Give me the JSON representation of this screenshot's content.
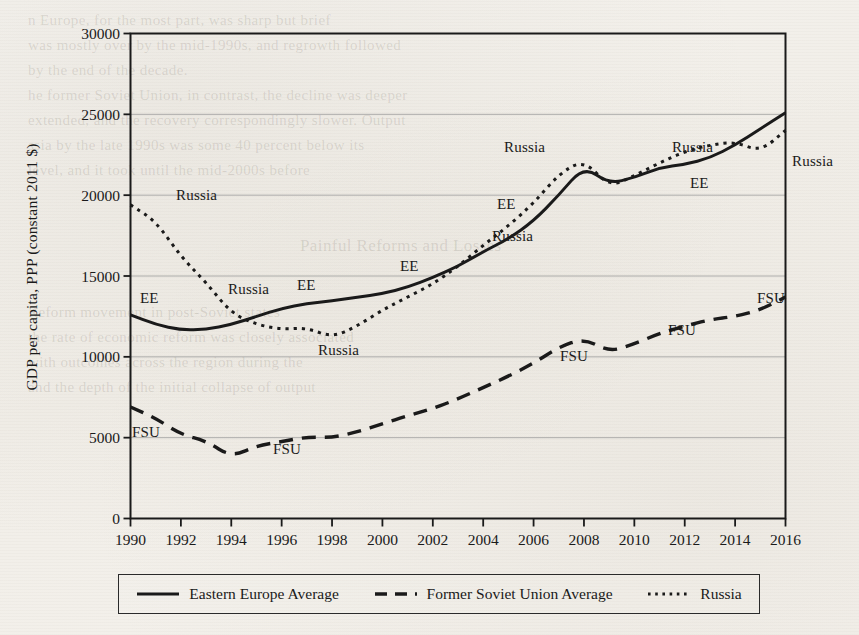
{
  "figure": {
    "background_color": "#f4f2ee",
    "ink_color": "#1a1a1a",
    "gridline_color": "#9a9a9a"
  },
  "axes": {
    "ylabel": "GDP per capita, PPP (constant 2011 $)",
    "xlabel": "",
    "yticks": [
      "30000",
      "25000",
      "20000",
      "15000",
      "10000",
      "5000",
      "0"
    ],
    "xticks": [
      "1990",
      "1992",
      "1994",
      "1996",
      "1998",
      "2000",
      "2002",
      "2004",
      "2006",
      "2008",
      "2010",
      "2012",
      "2014",
      "2016"
    ]
  },
  "legend": {
    "items": [
      {
        "label": "Eastern Europe Average",
        "style": "solid"
      },
      {
        "label": "Former Soviet Union Average",
        "style": "dashed"
      },
      {
        "label": "Russia",
        "style": "dotted"
      }
    ]
  },
  "inline_labels": [
    {
      "text": "EE",
      "x": 140,
      "y": 290
    },
    {
      "text": "Russia",
      "x": 176,
      "y": 187
    },
    {
      "text": "Russia",
      "x": 228,
      "y": 281
    },
    {
      "text": "Russia",
      "x": 318,
      "y": 342
    },
    {
      "text": "EE",
      "x": 297,
      "y": 277
    },
    {
      "text": "EE",
      "x": 400,
      "y": 258
    },
    {
      "text": "EE",
      "x": 497,
      "y": 196
    },
    {
      "text": "Russia",
      "x": 492,
      "y": 228
    },
    {
      "text": "Russia",
      "x": 504,
      "y": 139
    },
    {
      "text": "Russia",
      "x": 672,
      "y": 139
    },
    {
      "text": "EE",
      "x": 690,
      "y": 175
    },
    {
      "text": "Russia",
      "x": 792,
      "y": 153
    },
    {
      "text": "FSU",
      "x": 132,
      "y": 424
    },
    {
      "text": "FSU",
      "x": 273,
      "y": 441
    },
    {
      "text": "FSU",
      "x": 560,
      "y": 348
    },
    {
      "text": "FSU",
      "x": 668,
      "y": 322
    },
    {
      "text": "FSU",
      "x": 757,
      "y": 290
    }
  ],
  "chart_data": {
    "type": "line",
    "title": "",
    "xlabel": "",
    "ylabel": "GDP per capita, PPP (constant 2011 $)",
    "xlim": [
      1990,
      2016
    ],
    "ylim": [
      0,
      30000
    ],
    "ytick_step": 5000,
    "grid": true,
    "legend_position": "bottom",
    "x": [
      1990,
      1991,
      1992,
      1993,
      1994,
      1995,
      1996,
      1997,
      1998,
      1999,
      2000,
      2001,
      2002,
      2003,
      2004,
      2005,
      2006,
      2007,
      2008,
      2009,
      2010,
      2011,
      2012,
      2013,
      2014,
      2015,
      2016
    ],
    "series": [
      {
        "name": "Eastern Europe Average",
        "short": "EE",
        "style": "solid",
        "values": [
          12600,
          12000,
          11650,
          11700,
          12000,
          12500,
          13000,
          13300,
          13450,
          13700,
          13900,
          14300,
          14900,
          15600,
          16500,
          17300,
          18400,
          20000,
          21800,
          20700,
          21100,
          21700,
          21900,
          22300,
          23100,
          24100,
          25100
        ]
      },
      {
        "name": "Former Soviet Union Average",
        "short": "FSU",
        "style": "dashed",
        "values": [
          6900,
          6200,
          5200,
          4800,
          3800,
          4500,
          4750,
          5050,
          5000,
          5350,
          5850,
          6350,
          6800,
          7400,
          8100,
          8800,
          9600,
          10600,
          11150,
          10300,
          10800,
          11450,
          11900,
          12300,
          12500,
          12900,
          13700
        ]
      },
      {
        "name": "Russia",
        "short": "Russia",
        "style": "dotted",
        "values": [
          19400,
          18400,
          16200,
          14600,
          12700,
          12000,
          11700,
          11800,
          11200,
          11900,
          12900,
          13700,
          14500,
          15600,
          16900,
          18100,
          19500,
          21300,
          22200,
          20500,
          21200,
          22000,
          22700,
          23100,
          23300,
          22700,
          24000
        ]
      }
    ]
  }
}
